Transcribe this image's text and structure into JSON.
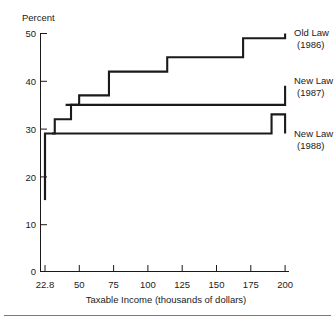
{
  "chart_data": {
    "type": "line",
    "title": "",
    "subtitle": "",
    "xlabel": "Taxable Income (thousands of dollars)",
    "ylabel": "Percent",
    "xlim": [
      22.8,
      200
    ],
    "ylim": [
      0,
      50
    ],
    "grid": false,
    "legend_position": "right-inline",
    "x_ticks": [
      22.8,
      50,
      75,
      100,
      125,
      150,
      175,
      200
    ],
    "x_tick_labels": [
      "22.8",
      "50",
      "75",
      "100",
      "125",
      "150",
      "175",
      "200"
    ],
    "y_ticks": [
      0,
      10,
      20,
      30,
      40,
      50
    ],
    "y_tick_labels": [
      "0",
      "10",
      "20",
      "30",
      "40",
      "50"
    ],
    "series": [
      {
        "name": "Old Law (1986)",
        "label_line1": "Old Law",
        "label_line2": "(1986)",
        "step_x": [
          22.8,
          22.8,
          22.8,
          25.8,
          30.0,
          34.0,
          42.0,
          48.0,
          57.0,
          70.0,
          90.0,
          113.0,
          169.0,
          200.0
        ],
        "step_y": [
          15,
          25,
          29,
          29,
          32,
          32,
          35,
          37,
          37,
          42,
          42,
          45,
          49,
          50
        ],
        "values": [
          15,
          25,
          29,
          32,
          35,
          37,
          42,
          45,
          49,
          50
        ],
        "breakpoints": [
          22.8,
          25.8,
          30.0,
          34.0,
          42.0,
          48.0,
          57.0,
          70.0,
          90.0,
          113.0,
          169.0
        ]
      },
      {
        "name": "New Law (1987)",
        "label_line1": "New Law",
        "label_line2": "(1987)",
        "step_x": [
          38.0,
          90.0,
          200.0
        ],
        "step_y": [
          35,
          35,
          39
        ],
        "values": [
          35,
          39
        ],
        "breakpoints": [
          38.0,
          90.0
        ]
      },
      {
        "name": "New Law (1988)",
        "label_line1": "New Law",
        "label_line2": "(1988)",
        "step_x": [
          28.0,
          74.0,
          190.0,
          200.0
        ],
        "step_y": [
          29,
          29,
          33,
          29
        ],
        "values": [
          29,
          33,
          29
        ],
        "breakpoints": [
          28.0,
          74.0,
          190.0
        ]
      }
    ]
  },
  "axes": {
    "y_axis_label": "Percent",
    "x_axis_label": "Taxable Income (thousands of dollars)"
  },
  "labels": {
    "y_title": "Percent",
    "x_title": "Taxable Income (thousands of dollars)",
    "y_50": "50",
    "y_40": "40",
    "y_30": "30",
    "y_20": "20",
    "y_10": "10",
    "y_0": "0",
    "x_228": "22.8",
    "x_50": "50",
    "x_75": "75",
    "x_100": "100",
    "x_125": "125",
    "x_150": "150",
    "x_175": "175",
    "x_200": "200",
    "old_law_1": "Old Law",
    "old_law_2": "(1986)",
    "new_law_87_1": "New Law",
    "new_law_87_2": "(1987)",
    "new_law_88_1": "New Law",
    "new_law_88_2": "(1988)"
  },
  "colors": {
    "ink": "#1a1a1a",
    "background": "#ffffff",
    "rule": "#7a7a7a"
  }
}
